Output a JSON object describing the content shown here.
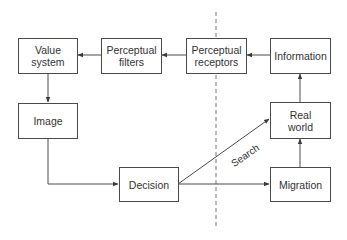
{
  "diagram": {
    "type": "flowchart",
    "colors": {
      "line": "#4a4a4a",
      "text": "#333333",
      "background": "#ffffff",
      "divider": "#777777"
    },
    "nodes": [
      {
        "id": "value_system",
        "lines": [
          "Value",
          "system"
        ]
      },
      {
        "id": "perceptual_filters",
        "lines": [
          "Perceptual",
          "filters"
        ]
      },
      {
        "id": "perceptual_receptors",
        "lines": [
          "Perceptual",
          "receptors"
        ]
      },
      {
        "id": "information",
        "lines": [
          "Information"
        ]
      },
      {
        "id": "image",
        "lines": [
          "Image"
        ]
      },
      {
        "id": "decision",
        "lines": [
          "Decision"
        ]
      },
      {
        "id": "real_world",
        "lines": [
          "Real",
          "world"
        ]
      },
      {
        "id": "migration",
        "lines": [
          "Migration"
        ]
      }
    ],
    "edges": [
      {
        "from": "information",
        "to": "perceptual_receptors"
      },
      {
        "from": "perceptual_receptors",
        "to": "perceptual_filters"
      },
      {
        "from": "perceptual_filters",
        "to": "value_system"
      },
      {
        "from": "value_system",
        "to": "image"
      },
      {
        "from": "image",
        "to": "decision"
      },
      {
        "from": "decision",
        "to": "migration"
      },
      {
        "from": "decision",
        "to": "real_world",
        "label": "Search"
      },
      {
        "from": "migration",
        "to": "real_world"
      },
      {
        "from": "real_world",
        "to": "information"
      }
    ],
    "search_label": "Search",
    "divider": "dashed vertical line"
  }
}
